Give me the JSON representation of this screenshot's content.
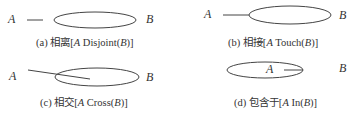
{
  "panels": [
    {
      "id": "a",
      "label_a": "A",
      "label_b": "B",
      "caption_prefix": "(a) 相离[",
      "caption_a": "A",
      "caption_rel": " Disjoint(",
      "caption_b": "B",
      "caption_suffix": ")]"
    },
    {
      "id": "b",
      "label_a": "A",
      "label_b": "B",
      "caption_prefix": "(b) 相接[",
      "caption_a": "A",
      "caption_rel": " Touch(",
      "caption_b": "B",
      "caption_suffix": ")]"
    },
    {
      "id": "c",
      "label_a": "A",
      "label_b": "B",
      "caption_prefix": "(c) 相交[",
      "caption_a": "A",
      "caption_rel": " Cross(",
      "caption_b": "B",
      "caption_suffix": ")]"
    },
    {
      "id": "d",
      "label_a": "A",
      "label_b": "B",
      "caption_prefix": "(d) 包含于[",
      "caption_a": "A",
      "caption_rel": " In(",
      "caption_b": "B",
      "caption_suffix": ")]"
    }
  ],
  "colors": {
    "stroke": "#444444",
    "text": "#333333"
  }
}
